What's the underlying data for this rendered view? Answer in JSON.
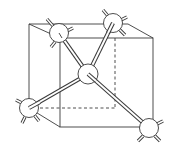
{
  "diagram": {
    "title": "Tetrahedral bonding in a cubic unit cell",
    "colors": {
      "line": "#3a3a3a",
      "atom_fill": "#ffffff",
      "background": "#ffffff"
    },
    "cube": {
      "back_face": {
        "tl": [
          29,
          24
        ],
        "tr": [
          128,
          24
        ],
        "bl": [
          29,
          108
        ],
        "br": [
          115,
          108
        ]
      },
      "front_face": {
        "tl": [
          60,
          38
        ],
        "tr": [
          153,
          38
        ],
        "bl": [
          60,
          127
        ],
        "br": [
          153,
          127
        ]
      }
    },
    "atoms": [
      {
        "id": "center",
        "x": 88,
        "y": 74,
        "r": 10
      },
      {
        "id": "top-left",
        "x": 59,
        "y": 33,
        "r": 10
      },
      {
        "id": "top-right",
        "x": 113,
        "y": 23,
        "r": 10
      },
      {
        "id": "bottom-left",
        "x": 29,
        "y": 108,
        "r": 10
      },
      {
        "id": "bottom-right",
        "x": 149,
        "y": 128,
        "r": 10
      }
    ]
  }
}
